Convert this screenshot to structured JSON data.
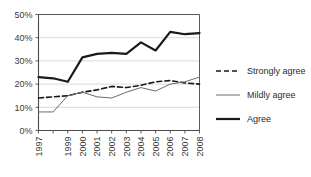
{
  "chart_data": {
    "type": "line",
    "title": "",
    "xlabel": "",
    "ylabel": "",
    "ylim": [
      0,
      50
    ],
    "yticks": [
      0,
      10,
      20,
      30,
      40,
      50
    ],
    "ytick_labels": [
      "0%",
      "10%",
      "20%",
      "30%",
      "40%",
      "50%"
    ],
    "grid": true,
    "grid_axis": "y",
    "legend_position": "right",
    "categories": [
      1997,
      1998,
      1999,
      2000,
      2001,
      2002,
      2003,
      2004,
      2005,
      2006,
      2007,
      2008
    ],
    "xtick_labels": [
      "1997",
      "",
      "1999",
      "2000",
      "2001",
      "2002",
      "2003",
      "2004",
      "2005",
      "2006",
      "2007",
      "2008"
    ],
    "xtick_labels_visible": [
      "1997",
      "1999",
      "2000",
      "2001",
      "2002",
      "2003",
      "2004",
      "2005",
      "2006",
      "2007",
      "2008"
    ],
    "xtick_rotation": 90,
    "series": [
      {
        "name": "Strongly agree",
        "style": "dashed",
        "width": 1.6,
        "color": "#1a1a1a",
        "values": [
          14,
          14.5,
          15,
          16.5,
          17.5,
          19,
          18.5,
          19.5,
          21,
          21.5,
          20.5,
          20
        ]
      },
      {
        "name": "Mildly agree",
        "style": "solid",
        "width": 1.0,
        "color": "#6b6b6b",
        "values": [
          8,
          8,
          15,
          16.5,
          14.5,
          14,
          16.5,
          18.5,
          17,
          20,
          21,
          23
        ]
      },
      {
        "name": "Agree",
        "style": "solid",
        "width": 2.2,
        "color": "#1a1a1a",
        "values": [
          23,
          22.5,
          21,
          31.5,
          33,
          33.5,
          33,
          38,
          34.5,
          42.5,
          41.5,
          42
        ]
      }
    ]
  },
  "legend": {
    "items": [
      {
        "label": "Strongly agree",
        "style": "dashed"
      },
      {
        "label": "Mildly agree",
        "style": "thin"
      },
      {
        "label": "Agree",
        "style": "thick"
      }
    ]
  },
  "colors": {
    "axis": "#4a4a4a",
    "grid": "#cfcfcf",
    "text": "#2b2b2b",
    "background": "#ffffff"
  }
}
